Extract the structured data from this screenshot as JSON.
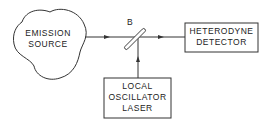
{
  "diagram": {
    "type": "block-diagram",
    "nodes": [
      {
        "id": "emission-source",
        "lines": [
          "EMISSION",
          "SOURCE"
        ],
        "shape": "cloud"
      },
      {
        "id": "beam-splitter",
        "label": "B",
        "shape": "mirror"
      },
      {
        "id": "heterodyne-detector",
        "lines": [
          "HETERODYNE",
          "DETECTOR"
        ],
        "shape": "rectangle"
      },
      {
        "id": "local-oscillator-laser",
        "lines": [
          "LOCAL",
          "OSCILLATOR",
          "LASER"
        ],
        "shape": "rectangle"
      }
    ],
    "edges": [
      {
        "from": "emission-source",
        "to": "beam-splitter"
      },
      {
        "from": "local-oscillator-laser",
        "to": "beam-splitter"
      },
      {
        "from": "beam-splitter",
        "to": "heterodyne-detector"
      }
    ],
    "colors": {
      "stroke": "#333333",
      "text": "#222222",
      "background": "#ffffff"
    }
  }
}
